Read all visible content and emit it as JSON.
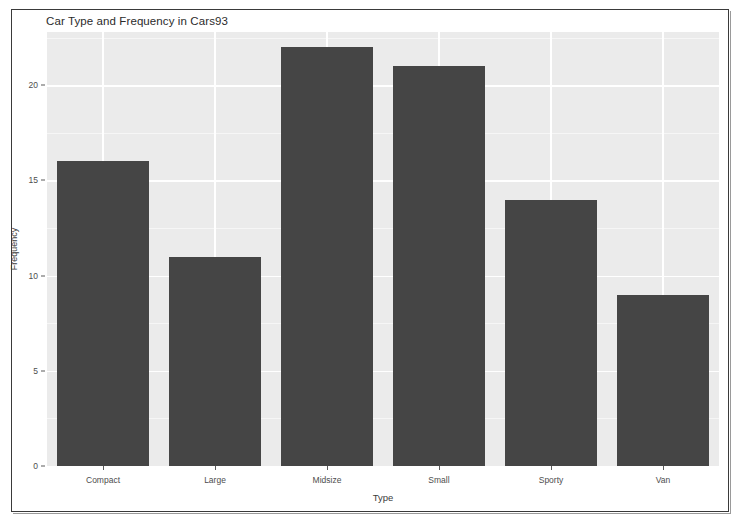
{
  "chart_data": {
    "type": "bar",
    "title": "Car Type and Frequency in Cars93",
    "xlabel": "Type",
    "ylabel": "Frequency",
    "categories": [
      "Compact",
      "Large",
      "Midsize",
      "Small",
      "Sporty",
      "Van"
    ],
    "values": [
      16,
      11,
      22,
      21,
      14,
      9
    ],
    "ylim": [
      0,
      22.8
    ],
    "yticks": [
      0,
      5,
      10,
      15,
      20
    ],
    "ytick_labels": [
      "0",
      "5",
      "10",
      "15",
      "20"
    ],
    "yticks_minor": [
      2.5,
      7.5,
      12.5,
      17.5,
      22.5
    ],
    "grid": true,
    "legend": "none",
    "colors": {
      "bar_fill": "#454545",
      "panel_background": "#ebebeb",
      "gridline_major": "#ffffff",
      "gridline_minor": "#f6f6f6",
      "figure_background": "#ffffff",
      "text": "#4d4d4d",
      "frame": "#3a3a3a"
    }
  }
}
